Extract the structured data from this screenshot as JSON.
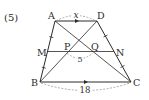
{
  "problem": {
    "number_label": "(5)"
  },
  "diagram": {
    "type": "trapezoid",
    "colors": {
      "line": "#2a2a2a",
      "dashed": "#8a8a8a",
      "text": "#2a2a2a"
    },
    "points": {
      "A": {
        "label": "A",
        "x": 55,
        "y": 21
      },
      "D": {
        "label": "D",
        "x": 97,
        "y": 21
      },
      "M": {
        "label": "M",
        "x": 47.5,
        "y": 51.5
      },
      "N": {
        "label": "N",
        "x": 114,
        "y": 51.5
      },
      "P": {
        "label": "P",
        "x": 66,
        "y": 51.5
      },
      "Q": {
        "label": "Q",
        "x": 93,
        "y": 51.5
      },
      "B": {
        "label": "B",
        "x": 40,
        "y": 82
      },
      "C": {
        "label": "C",
        "x": 131,
        "y": 82
      }
    },
    "measurements": {
      "AD": "x",
      "PQ": "5",
      "BC": "18"
    },
    "parallel_marks": [
      "AD",
      "BC"
    ],
    "equal_tick_segments": [
      "AM",
      "MB",
      "DN",
      "NC"
    ]
  }
}
